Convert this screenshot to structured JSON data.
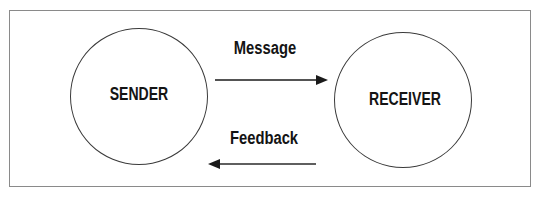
{
  "diagram": {
    "type": "communication-model",
    "nodes": [
      {
        "id": "sender",
        "label": "SENDER"
      },
      {
        "id": "receiver",
        "label": "RECEIVER"
      }
    ],
    "edges": [
      {
        "id": "message",
        "from": "sender",
        "to": "receiver",
        "label": "Message"
      },
      {
        "id": "feedback",
        "from": "receiver",
        "to": "sender",
        "label": "Feedback"
      }
    ]
  },
  "colors": {
    "frame": "#8a8a8a",
    "circle_stroke": "#3a3a3a",
    "text": "#141414",
    "arrow": "#1a1a1a",
    "background": "#ffffff"
  }
}
